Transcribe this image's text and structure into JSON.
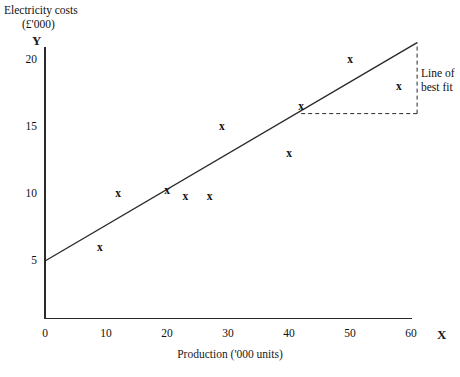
{
  "chart_data": {
    "type": "scatter",
    "title": "Electricity costs (£'000)",
    "title_line1": "Electricity costs",
    "title_line2": "(£'000)",
    "xlabel": "Production ('000 units)",
    "ylabel": "Electricity costs (£'000)",
    "x_axis_name": "X",
    "y_axis_name": "Y",
    "xlim": [
      0,
      62
    ],
    "ylim": [
      0,
      22.5
    ],
    "xticks": [
      0,
      10,
      20,
      30,
      40,
      50,
      60
    ],
    "xtick_labels": [
      "0",
      "10",
      "20",
      "30",
      "40",
      "50",
      "60"
    ],
    "yticks": [
      5,
      10,
      15,
      20
    ],
    "ytick_labels": [
      "5",
      "10",
      "15",
      "20"
    ],
    "grid": false,
    "legend": "none",
    "marker": "x",
    "points": [
      {
        "x": 12,
        "y": 10.0
      },
      {
        "x": 9,
        "y": 6.0
      },
      {
        "x": 20,
        "y": 10.2
      },
      {
        "x": 23,
        "y": 9.8
      },
      {
        "x": 27,
        "y": 9.8
      },
      {
        "x": 29,
        "y": 15.0
      },
      {
        "x": 40,
        "y": 13.0
      },
      {
        "x": 42,
        "y": 16.5
      },
      {
        "x": 50,
        "y": 20.0
      },
      {
        "x": 58,
        "y": 18.0
      }
    ],
    "trendline": {
      "label": "Line of best fit",
      "label_line1": "Line of",
      "label_line2": "best fit",
      "from": {
        "x": 0,
        "y": 5.0
      },
      "to": {
        "x": 61,
        "y": 21.3
      },
      "intercept": 5.0,
      "slope": 0.267
    },
    "annotation_triangle": {
      "horizontal_from": {
        "x": 42,
        "y": 16.0
      },
      "horizontal_to": {
        "x": 61,
        "y": 16.0
      },
      "vertical_x": 61,
      "vertical_from_y": 16.0,
      "vertical_to_y": 21.3,
      "style": "dashed"
    },
    "colors": {
      "axis": "#2a2a2a",
      "line": "#2a2a2a",
      "marker": "#111111",
      "background": "#ffffff"
    }
  }
}
